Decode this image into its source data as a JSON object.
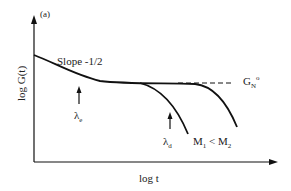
{
  "figure": {
    "panel_label": "(a)",
    "axes": {
      "y_label": "log G(t)",
      "x_label": "log t"
    },
    "annotations": {
      "slope": "Slope -1/2",
      "lambda_e": {
        "symbol": "λ",
        "subscript": "e"
      },
      "lambda_d": {
        "symbol": "λ",
        "subscript": "d"
      },
      "plateau_modulus": {
        "symbol": "G",
        "subscript": "N",
        "superscript": "o"
      },
      "mass_relation": {
        "m1": "M",
        "m1_sub": "1",
        "relation": " < ",
        "m2": "M",
        "m2_sub": "2"
      }
    },
    "curves": [
      {
        "name": "M1",
        "description": "shorter chain, terminal relaxation at λd"
      },
      {
        "name": "M2",
        "description": "longer chain, extended plateau"
      }
    ],
    "plateau_line_style": "dashed",
    "colors": {
      "line": "#111111",
      "background": "#ffffff"
    }
  }
}
